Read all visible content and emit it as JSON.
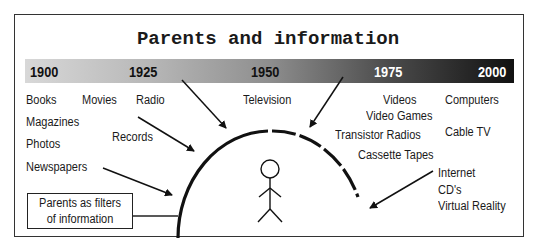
{
  "title": "Parents and information",
  "timeline": {
    "years": [
      "1900",
      "1925",
      "1950",
      "1975",
      "2000"
    ],
    "gradient": {
      "start": "#d8d8d8",
      "end": "#111111"
    }
  },
  "media": {
    "books": "Books",
    "movies": "Movies",
    "radio": "Radio",
    "magazines": "Magazines",
    "records": "Records",
    "photos": "Photos",
    "newspapers": "Newspapers",
    "television": "Television",
    "videos": "Videos",
    "video_games": "Video Games",
    "transistor_radios": "Transistor Radios",
    "cassette_tapes": "Cassette Tapes",
    "computers": "Computers",
    "cable_tv": "Cable TV",
    "internet": "Internet",
    "cds": "CD's",
    "virtual_reality": "Virtual Reality"
  },
  "filter_box": {
    "line1": "Parents as filters",
    "line2": "of information"
  }
}
